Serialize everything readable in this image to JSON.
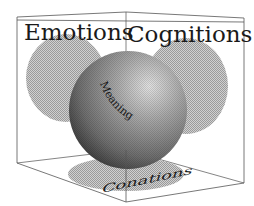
{
  "diagram": {
    "type": "3d-box-with-projections",
    "labels": {
      "emotions": "Emotions",
      "cognitions": "Cognitions",
      "conations": "Conations",
      "meaning": "Meaning"
    },
    "colors": {
      "background": "#ffffff",
      "box_edge": "#555555",
      "projection_fill": "#bdbdbd",
      "sphere_light": "#d6d6d6",
      "sphere_mid": "#8a8a8a",
      "sphere_dark": "#3a3a3a",
      "text": "#1a1a1a"
    },
    "projections": [
      {
        "name": "emotions-projection",
        "face": "left-back"
      },
      {
        "name": "cognitions-projection",
        "face": "right-back"
      },
      {
        "name": "conations-projection",
        "face": "floor"
      }
    ],
    "center_object": "sphere"
  }
}
